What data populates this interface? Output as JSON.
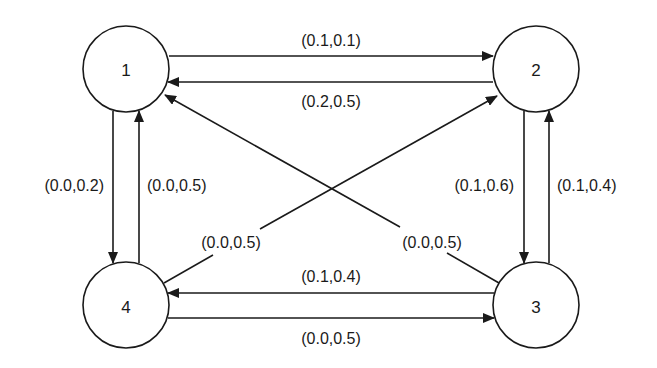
{
  "diagram": {
    "type": "state-transition-graph",
    "colors": {
      "stroke": "#1a1a1a",
      "background": "#ffffff"
    },
    "nodes": [
      {
        "id": "1",
        "label": "1",
        "cx": 126,
        "cy": 69,
        "r": 43
      },
      {
        "id": "2",
        "label": "2",
        "cx": 536,
        "cy": 69,
        "r": 43
      },
      {
        "id": "3",
        "label": "3",
        "cx": 536,
        "cy": 305,
        "r": 43
      },
      {
        "id": "4",
        "label": "4",
        "cx": 126,
        "cy": 305,
        "r": 43
      }
    ],
    "edges": [
      {
        "from": "1",
        "to": "2",
        "label": "(0.1,0.1)"
      },
      {
        "from": "2",
        "to": "1",
        "label": "(0.2,0.5)"
      },
      {
        "from": "1",
        "to": "4",
        "label": "(0.0,0.2)"
      },
      {
        "from": "4",
        "to": "1",
        "label": "(0.0,0.5)"
      },
      {
        "from": "2",
        "to": "3",
        "label": "(0.1,0.6)"
      },
      {
        "from": "3",
        "to": "2",
        "label": "(0.1,0.4)"
      },
      {
        "from": "3",
        "to": "4",
        "label": "(0.1,0.4)"
      },
      {
        "from": "4",
        "to": "3",
        "label": "(0.0,0.5)"
      },
      {
        "from": "4",
        "to": "2",
        "label": "(0.0,0.5)"
      },
      {
        "from": "3",
        "to": "1",
        "label": "(0.0,0.5)"
      }
    ]
  }
}
